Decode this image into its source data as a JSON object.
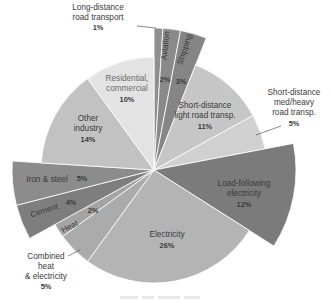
{
  "chart_data": {
    "type": "pie",
    "title": "",
    "center": [
      154,
      170
    ],
    "radius": 113,
    "exploded_radius": 142,
    "start_angle_deg": 0,
    "direction": "clockwise",
    "slices": [
      {
        "label": "Long-distance road transport",
        "value": 1,
        "pct_label": "1%",
        "color": "#8f8f8f",
        "exploded": true
      },
      {
        "label": "Aviation",
        "value": 2,
        "pct_label": "2%",
        "color": "#8a8a8a",
        "exploded": true
      },
      {
        "label": "Shipping",
        "value": 3,
        "pct_label": "3%",
        "color": "#858585",
        "exploded": true
      },
      {
        "label": "Short-distance light road transp.",
        "value": 11,
        "pct_label": "11%",
        "color": "#c6c6c6",
        "exploded": false
      },
      {
        "label": "Short-distance med/heavy road transp.",
        "value": 5,
        "pct_label": "5%",
        "color": "#d0d0d0",
        "exploded": false
      },
      {
        "label": "Load-following electricity",
        "value": 12,
        "pct_label": "12%",
        "color": "#7b7b7b",
        "exploded": true
      },
      {
        "label": "Electricity",
        "value": 26,
        "pct_label": "26%",
        "color": "#b4b4b4",
        "exploded": false
      },
      {
        "label": "Combined heat & electricity",
        "value": 5,
        "pct_label": "5%",
        "color": "#ababab",
        "exploded": false
      },
      {
        "label": "Heat",
        "value": 2,
        "pct_label": "2%",
        "color": "#a4a4a4",
        "exploded": false
      },
      {
        "label": "Cement",
        "value": 4,
        "pct_label": "4%",
        "color": "#7e7e7e",
        "exploded": true
      },
      {
        "label": "Iron & steel",
        "value": 5,
        "pct_label": "5%",
        "color": "#8c8c8c",
        "exploded": true
      },
      {
        "label": "Other industry",
        "value": 14,
        "pct_label": "14%",
        "color": "#c2c2c2",
        "exploded": false
      },
      {
        "label": "Residential, commercial",
        "value": 10,
        "pct_label": "10%",
        "color": "#e3e3e3",
        "exploded": false
      }
    ],
    "legend": null,
    "grid": false
  },
  "labels": {
    "long_distance": {
      "line1": "Long-distance",
      "line2": "road transport",
      "pct": "1%"
    },
    "aviation": {
      "name": "Aviation",
      "pct": "2%"
    },
    "shipping": {
      "name": "Shipping",
      "pct": "3%"
    },
    "light_road": {
      "line1": "Short-distance",
      "line2": "light road transp.",
      "pct": "11%"
    },
    "med_heavy": {
      "line1": "Short-distance",
      "line2": "med/heavy",
      "line3": "road transp.",
      "pct": "5%"
    },
    "load_following": {
      "line1": "Load-following",
      "line2": "electricity",
      "pct": "12%"
    },
    "electricity": {
      "name": "Electricity",
      "pct": "26%"
    },
    "chp": {
      "line1": "Combined",
      "line2": "heat",
      "line3": "& electricity",
      "pct": "5%"
    },
    "heat": {
      "name": "Heat",
      "pct": "2%"
    },
    "cement": {
      "name": "Cement",
      "pct": "4%"
    },
    "iron_steel": {
      "name": "Iron & steel",
      "pct": "5%"
    },
    "other_industry": {
      "line1": "Other",
      "line2": "industry",
      "pct": "14%"
    },
    "residential": {
      "line1": "Residential,",
      "line2": "commercial",
      "pct": "10%"
    }
  }
}
